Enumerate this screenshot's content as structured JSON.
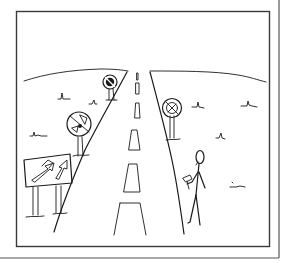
{
  "comic": {
    "alt": "Hand-drawn comic panel: a straight road receding to the horizon with dashed center line, round prohibition signs on both roadsides, a rectangular sign with arrows on the left, and a stick figure holding a hammer walking beside the road.",
    "colors": {
      "background": "#ffffff",
      "ink": "#1a1a1a",
      "frame": "#3a3a3a",
      "page_edge": "#555555"
    },
    "elements": [
      "panel-frame",
      "horizon-hills",
      "road-left-edge",
      "road-right-edge",
      "center-dashes",
      "prohibition-sign-far-left",
      "prohibition-sign-mid-left",
      "prohibition-sign-right",
      "arrow-billboard",
      "stick-figure-with-hammer",
      "grass-tufts"
    ]
  }
}
